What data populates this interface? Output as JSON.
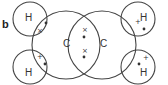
{
  "diagram": {
    "part_label": "b",
    "molecule": "ethene dot-and-cross",
    "atoms": {
      "carbon_left": "C",
      "carbon_right": "C",
      "hydrogen_top_left": "H",
      "hydrogen_bottom_left": "H",
      "hydrogen_top_right": "H",
      "hydrogen_bottom_right": "H"
    },
    "electron_symbols": {
      "cross": "×",
      "plus": "+",
      "dot": "•"
    },
    "colors": {
      "stroke": "#444444",
      "text": "#333333"
    }
  }
}
